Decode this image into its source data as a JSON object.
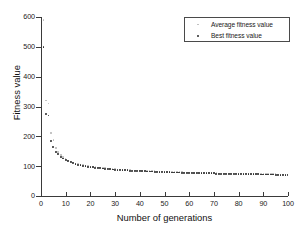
{
  "chart_data": {
    "type": "scatter",
    "title": "",
    "xlabel": "Number of generations",
    "ylabel": "Fitness value",
    "xlim": [
      0,
      100
    ],
    "ylim": [
      0,
      600
    ],
    "xticks": [
      0,
      10,
      20,
      30,
      40,
      50,
      60,
      70,
      80,
      90,
      100
    ],
    "yticks": [
      0,
      100,
      200,
      300,
      400,
      500,
      600
    ],
    "grid": false,
    "legend": {
      "position": "top-right",
      "entries": [
        {
          "name": "Average fitness value",
          "marker": "dot",
          "color": "#b9b9b9"
        },
        {
          "name": "Best fitness value",
          "marker": "dot",
          "color": "#2a2a2a"
        }
      ]
    },
    "x": [
      1,
      2,
      3,
      4,
      5,
      6,
      7,
      8,
      9,
      10,
      11,
      12,
      13,
      14,
      15,
      16,
      17,
      18,
      19,
      20,
      21,
      22,
      23,
      24,
      25,
      26,
      27,
      28,
      29,
      30,
      31,
      32,
      33,
      34,
      35,
      36,
      37,
      38,
      39,
      40,
      41,
      42,
      43,
      44,
      45,
      46,
      47,
      48,
      49,
      50,
      51,
      52,
      53,
      54,
      55,
      56,
      57,
      58,
      59,
      60,
      61,
      62,
      63,
      64,
      65,
      66,
      67,
      68,
      69,
      70,
      71,
      72,
      73,
      74,
      75,
      76,
      77,
      78,
      79,
      80,
      81,
      82,
      83,
      84,
      85,
      86,
      87,
      88,
      89,
      90,
      91,
      92,
      93,
      94,
      95,
      96,
      97,
      98,
      99,
      100
    ],
    "series": [
      {
        "name": "Average fitness value",
        "color": "#b9b9b9",
        "values": [
          590,
          320,
          310,
          212,
          188,
          160,
          148,
          138,
          130,
          124,
          119,
          115,
          112,
          109,
          107,
          105,
          103,
          101,
          100,
          99,
          98,
          97,
          96,
          95,
          94,
          93,
          92,
          91,
          91,
          90,
          89,
          89,
          88,
          88,
          87,
          87,
          86,
          86,
          85,
          85,
          84,
          84,
          84,
          83,
          83,
          83,
          82,
          82,
          82,
          81,
          81,
          81,
          81,
          80,
          80,
          80,
          80,
          79,
          79,
          79,
          79,
          78,
          78,
          78,
          78,
          78,
          77,
          77,
          77,
          77,
          77,
          76,
          76,
          76,
          76,
          76,
          76,
          75,
          75,
          75,
          75,
          75,
          75,
          74,
          74,
          74,
          74,
          74,
          74,
          73,
          73,
          73,
          73,
          73,
          73,
          72,
          72,
          72,
          72,
          72
        ]
      },
      {
        "name": "Best fitness value",
        "color": "#2a2a2a",
        "values": [
          500,
          275,
          270,
          185,
          165,
          148,
          140,
          132,
          126,
          120,
          116,
          113,
          110,
          107,
          105,
          103,
          101,
          100,
          98,
          97,
          96,
          95,
          94,
          93,
          92,
          91,
          91,
          90,
          89,
          88,
          88,
          87,
          87,
          86,
          86,
          85,
          85,
          84,
          84,
          84,
          83,
          83,
          82,
          82,
          82,
          81,
          81,
          81,
          80,
          80,
          80,
          80,
          79,
          79,
          79,
          79,
          78,
          78,
          78,
          78,
          77,
          77,
          77,
          77,
          77,
          76,
          76,
          76,
          76,
          76,
          75,
          75,
          75,
          75,
          75,
          75,
          74,
          74,
          74,
          74,
          74,
          74,
          73,
          73,
          73,
          73,
          73,
          73,
          72,
          72,
          72,
          72,
          72,
          72,
          71,
          71,
          71,
          71,
          71,
          70
        ]
      }
    ]
  },
  "axes": {
    "y_tick_labels": [
      "0",
      "100",
      "200",
      "300",
      "400",
      "500",
      "600"
    ],
    "x_tick_labels": [
      "0",
      "10",
      "20",
      "30",
      "40",
      "50",
      "60",
      "70",
      "80",
      "90",
      "100"
    ],
    "y_axis_title": "Fitness value",
    "x_axis_title": "Number of generations"
  },
  "legend": {
    "avg_label": "Average fitness value",
    "best_label": "Best fitness value"
  },
  "colors": {
    "avg_marker": "#b9b9b9",
    "best_marker": "#2a2a2a",
    "axis": "#3a3a3a",
    "background": "#ffffff"
  }
}
